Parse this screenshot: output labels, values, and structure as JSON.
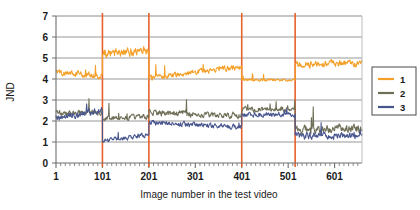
{
  "chart_data": {
    "type": "line",
    "title": "",
    "xlabel": "Image number in the test video",
    "ylabel": "JND",
    "xlim": [
      1,
      660
    ],
    "ylim": [
      0,
      7
    ],
    "xticks": [
      1,
      101,
      201,
      301,
      401,
      501,
      601
    ],
    "xtick_labels": [
      "1",
      "101",
      "201",
      "301",
      "401",
      "501",
      "601"
    ],
    "yticks": [
      0,
      1,
      2,
      3,
      4,
      5,
      6,
      7
    ],
    "ytick_labels": [
      "0",
      "1",
      "2",
      "3",
      "4",
      "5",
      "6",
      "7"
    ],
    "grid": "horizontal",
    "legend_position": "right-middle",
    "minor_tick_interval": 10,
    "segment_dividers": [
      101,
      201,
      401,
      516
    ],
    "divider_color": "#E8622A",
    "series": [
      {
        "name": "1",
        "label": "1",
        "color": "#F4A028",
        "segments": [
          {
            "x_start": 1,
            "x_end": 101,
            "level": 4.35,
            "trend": -0.25,
            "noise": 0.22
          },
          {
            "x_start": 101,
            "x_end": 201,
            "level": 5.25,
            "trend": 0.1,
            "noise": 0.34
          },
          {
            "x_start": 201,
            "x_end": 401,
            "level": 4.05,
            "trend": 0.55,
            "noise": 0.2
          },
          {
            "x_start": 401,
            "x_end": 516,
            "level": 3.95,
            "trend": 0.0,
            "noise": 0.1
          },
          {
            "x_start": 516,
            "x_end": 660,
            "level": 4.7,
            "trend": 0.05,
            "noise": 0.24
          }
        ]
      },
      {
        "name": "2",
        "label": "2",
        "color": "#6E6E57",
        "segments": [
          {
            "x_start": 1,
            "x_end": 101,
            "level": 2.35,
            "trend": 0.1,
            "noise": 0.2
          },
          {
            "x_start": 101,
            "x_end": 201,
            "level": 2.15,
            "trend": 0.05,
            "noise": 0.2
          },
          {
            "x_start": 201,
            "x_end": 401,
            "level": 2.4,
            "trend": -0.15,
            "noise": 0.22
          },
          {
            "x_start": 401,
            "x_end": 516,
            "level": 2.55,
            "trend": 0.0,
            "noise": 0.18
          },
          {
            "x_start": 516,
            "x_end": 660,
            "level": 1.6,
            "trend": 0.05,
            "noise": 0.3
          }
        ]
      },
      {
        "name": "3",
        "label": "3",
        "color": "#47558E",
        "segments": [
          {
            "x_start": 1,
            "x_end": 101,
            "level": 2.15,
            "trend": 0.35,
            "noise": 0.24
          },
          {
            "x_start": 101,
            "x_end": 201,
            "level": 1.05,
            "trend": 0.3,
            "noise": 0.16
          },
          {
            "x_start": 201,
            "x_end": 401,
            "level": 1.95,
            "trend": -0.25,
            "noise": 0.18
          },
          {
            "x_start": 401,
            "x_end": 516,
            "level": 2.3,
            "trend": 0.0,
            "noise": 0.17
          },
          {
            "x_start": 516,
            "x_end": 660,
            "level": 1.3,
            "trend": 0.0,
            "noise": 0.25
          }
        ]
      }
    ],
    "colors": {
      "series_1": "#F4A028",
      "series_2": "#6E6E57",
      "series_3": "#47558E",
      "divider": "#E8622A",
      "grid": "#8c8c8c",
      "axis": "#6e6e6e"
    }
  },
  "legend": {
    "entries": [
      {
        "label": "1",
        "color": "#F4A028"
      },
      {
        "label": "2",
        "color": "#6E6E57"
      },
      {
        "label": "3",
        "color": "#47558E"
      }
    ]
  }
}
